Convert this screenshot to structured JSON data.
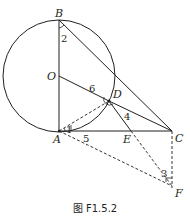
{
  "figure": {
    "caption": "图 F1.5.2",
    "points": {
      "B": {
        "label": "B",
        "x": 59,
        "y": 20
      },
      "O": {
        "label": "O",
        "x": 59,
        "y": 76
      },
      "A": {
        "label": "A",
        "x": 59,
        "y": 131
      },
      "D": {
        "label": "D",
        "x": 109,
        "y": 101
      },
      "E": {
        "label": "E",
        "x": 131,
        "y": 131
      },
      "C": {
        "label": "C",
        "x": 172,
        "y": 131
      },
      "F": {
        "label": "F",
        "x": 172,
        "y": 186
      }
    },
    "angle_labels": {
      "a1": "1",
      "a2": "2",
      "a3": "3",
      "a4": "4",
      "a5": "5",
      "a6": "6"
    },
    "circle": {
      "center": "O",
      "radius": 56
    },
    "colors": {
      "stroke": "#231f20"
    }
  }
}
